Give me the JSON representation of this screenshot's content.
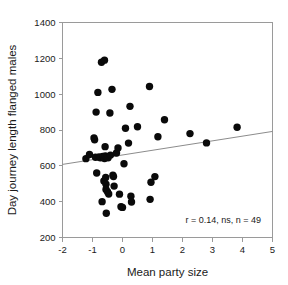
{
  "chart_data": {
    "type": "scatter",
    "title": "",
    "xlabel": "Mean party size",
    "ylabel": "Day journey length flanged males",
    "xlim": [
      -2,
      5
    ],
    "ylim": [
      200,
      1400
    ],
    "xticks": [
      -2,
      -1,
      0,
      1,
      2,
      3,
      4,
      5
    ],
    "yticks": [
      200,
      400,
      600,
      800,
      1000,
      1200,
      1400
    ],
    "xtick_labels": [
      "-2",
      "-1",
      "0",
      "1",
      "2",
      "3",
      "4",
      "5"
    ],
    "ytick_labels": [
      "200",
      "400",
      "600",
      "800",
      "1000",
      "1200",
      "1400"
    ],
    "grid": false,
    "legend": null,
    "annotation": "r = 0.14, ns, n = 49",
    "annotation_position": {
      "x": 3.15,
      "y": 282
    },
    "marker_color": "#0a0a0a",
    "marker_size": 5.2,
    "trend_line": {
      "type": "linear-regression",
      "color": "#8c8c8c",
      "x_start": -2,
      "y_start": 608,
      "x_end": 5,
      "y_end": 792
    },
    "stats": {
      "r": 0.14,
      "significance": "ns",
      "n": 49
    },
    "points": [
      {
        "x": -1.22,
        "y": 640
      },
      {
        "x": -1.1,
        "y": 663
      },
      {
        "x": -0.95,
        "y": 755
      },
      {
        "x": -0.93,
        "y": 745
      },
      {
        "x": -0.9,
        "y": 648
      },
      {
        "x": -0.88,
        "y": 900
      },
      {
        "x": -0.86,
        "y": 560
      },
      {
        "x": -0.82,
        "y": 1010
      },
      {
        "x": -0.78,
        "y": 650
      },
      {
        "x": -0.74,
        "y": 645
      },
      {
        "x": -0.7,
        "y": 1178
      },
      {
        "x": -0.68,
        "y": 400
      },
      {
        "x": -0.66,
        "y": 652
      },
      {
        "x": -0.63,
        "y": 648
      },
      {
        "x": -0.62,
        "y": 516
      },
      {
        "x": -0.6,
        "y": 641
      },
      {
        "x": -0.6,
        "y": 1190
      },
      {
        "x": -0.58,
        "y": 707
      },
      {
        "x": -0.57,
        "y": 655
      },
      {
        "x": -0.56,
        "y": 535
      },
      {
        "x": -0.55,
        "y": 497
      },
      {
        "x": -0.55,
        "y": 468
      },
      {
        "x": -0.54,
        "y": 335
      },
      {
        "x": -0.52,
        "y": 650
      },
      {
        "x": -0.5,
        "y": 455
      },
      {
        "x": -0.48,
        "y": 645
      },
      {
        "x": -0.46,
        "y": 443
      },
      {
        "x": -0.42,
        "y": 895
      },
      {
        "x": -0.4,
        "y": 660
      },
      {
        "x": -0.35,
        "y": 1027
      },
      {
        "x": -0.32,
        "y": 548
      },
      {
        "x": -0.3,
        "y": 540
      },
      {
        "x": -0.28,
        "y": 487
      },
      {
        "x": -0.2,
        "y": 672
      },
      {
        "x": -0.15,
        "y": 700
      },
      {
        "x": -0.1,
        "y": 442
      },
      {
        "x": -0.05,
        "y": 372
      },
      {
        "x": 0.0,
        "y": 368
      },
      {
        "x": 0.05,
        "y": 612
      },
      {
        "x": 0.1,
        "y": 810
      },
      {
        "x": 0.2,
        "y": 727
      },
      {
        "x": 0.25,
        "y": 932
      },
      {
        "x": 0.28,
        "y": 430
      },
      {
        "x": 0.3,
        "y": 398
      },
      {
        "x": 0.5,
        "y": 818
      },
      {
        "x": 0.9,
        "y": 1043
      },
      {
        "x": 0.92,
        "y": 413
      },
      {
        "x": 0.95,
        "y": 508
      },
      {
        "x": 1.08,
        "y": 540
      },
      {
        "x": 1.18,
        "y": 762
      },
      {
        "x": 1.4,
        "y": 857
      },
      {
        "x": 2.25,
        "y": 780
      },
      {
        "x": 2.8,
        "y": 728
      },
      {
        "x": 3.82,
        "y": 815
      }
    ]
  }
}
